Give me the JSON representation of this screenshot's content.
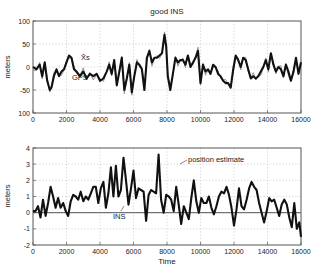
{
  "chart_data": [
    {
      "type": "line",
      "title": "good INS",
      "xlabel": "",
      "ylabel": "meters",
      "xlim": [
        0,
        16000
      ],
      "ylim": [
        -100,
        100
      ],
      "xticks": [
        0,
        2000,
        4000,
        6000,
        8000,
        10000,
        12000,
        14000,
        16000
      ],
      "xtick_labels": [
        "0",
        "2000",
        "4000",
        "6000",
        "8000",
        "10000",
        "12000",
        "14000",
        "16000"
      ],
      "yticks": [
        100,
        50,
        0,
        -50,
        -100
      ],
      "ytick_labels": [
        "100",
        "50",
        "0",
        "-50",
        "100"
      ],
      "grid": true,
      "annotations": [
        {
          "text": "X̂s",
          "x": 2700,
          "y": 18
        },
        {
          "text": "GPS",
          "x": 2400,
          "y": -18
        }
      ],
      "series": [
        {
          "name": "X̂s (estimate)",
          "style": "thick",
          "x": [
            0,
            200,
            400,
            550,
            700,
            850,
            1000,
            1100,
            1250,
            1400,
            1550,
            1700,
            1850,
            2000,
            2150,
            2300,
            2450,
            2600,
            2800,
            3000,
            3200,
            3400,
            3600,
            3800,
            4000,
            4200,
            4400,
            4550,
            4700,
            4850,
            5000,
            5150,
            5300,
            5450,
            5600,
            5750,
            5900,
            6050,
            6200,
            6350,
            6500,
            6650,
            6800,
            6950,
            7100,
            7250,
            7400,
            7550,
            7700,
            7850,
            7950,
            8050,
            8200,
            8350,
            8500,
            8650,
            8800,
            8950,
            9100,
            9250,
            9400,
            9550,
            9700,
            9850,
            10000,
            10150,
            10300,
            10450,
            10600,
            10750,
            10900,
            11050,
            11200,
            11350,
            11500,
            11650,
            11800,
            11950,
            12100,
            12250,
            12400,
            12550,
            12700,
            12850,
            13000,
            13150,
            13300,
            13450,
            13600,
            13750,
            13900,
            14050,
            14200,
            14350,
            14500,
            14650,
            14800,
            14950,
            15100,
            15250,
            15400,
            15550,
            15700,
            15850,
            16000
          ],
          "values": [
            0,
            -5,
            5,
            -20,
            10,
            -30,
            -50,
            -45,
            -20,
            -5,
            -20,
            -10,
            -5,
            10,
            25,
            20,
            -5,
            -10,
            -20,
            -10,
            -25,
            -15,
            -20,
            -15,
            -30,
            -25,
            -10,
            5,
            -15,
            15,
            -40,
            -10,
            20,
            -50,
            -25,
            5,
            -55,
            -20,
            10,
            5,
            -5,
            -50,
            20,
            35,
            10,
            20,
            20,
            25,
            30,
            70,
            45,
            -20,
            -50,
            -15,
            20,
            10,
            15,
            15,
            5,
            25,
            0,
            10,
            20,
            35,
            -35,
            5,
            -10,
            -5,
            -15,
            5,
            0,
            -15,
            -20,
            -30,
            -35,
            -35,
            -45,
            -5,
            25,
            15,
            0,
            20,
            15,
            -5,
            -25,
            -20,
            -25,
            -20,
            -10,
            0,
            15,
            -5,
            30,
            5,
            -10,
            0,
            -5,
            -20,
            5,
            -10,
            -30,
            -10,
            20,
            -15,
            10
          ],
          "color": "#111111"
        },
        {
          "name": "GPS",
          "style": "thin",
          "color": "#777777"
        }
      ]
    },
    {
      "type": "line",
      "title": "",
      "xlabel": "Time",
      "ylabel": "meters",
      "xlim": [
        0,
        16000
      ],
      "ylim": [
        -2,
        4
      ],
      "xticks": [
        0,
        2000,
        4000,
        6000,
        8000,
        10000,
        12000,
        14000,
        16000
      ],
      "xtick_labels": [
        "0",
        "2000",
        "4000",
        "6000",
        "8000",
        "10000",
        "12000",
        "14000",
        "16000"
      ],
      "yticks": [
        4,
        3,
        2,
        1,
        0,
        -1,
        -2
      ],
      "ytick_labels": [
        "4",
        "3",
        "2",
        "1",
        "0",
        "-1",
        "-2"
      ],
      "grid": true,
      "annotations": [
        {
          "text": "position estimate",
          "x": 8400,
          "y": 3.0
        },
        {
          "text": "INS",
          "x": 4700,
          "y": -0.75
        }
      ],
      "series": [
        {
          "name": "position estimate",
          "style": "thick",
          "x": [
            0,
            150,
            300,
            450,
            600,
            750,
            900,
            1050,
            1200,
            1350,
            1500,
            1650,
            1800,
            1950,
            2100,
            2250,
            2400,
            2550,
            2700,
            2850,
            3000,
            3150,
            3300,
            3450,
            3600,
            3750,
            3900,
            4050,
            4200,
            4350,
            4500,
            4650,
            4800,
            4950,
            5100,
            5250,
            5400,
            5550,
            5700,
            5850,
            6000,
            6150,
            6300,
            6450,
            6600,
            6750,
            6900,
            7050,
            7200,
            7350,
            7500,
            7650,
            7800,
            7950,
            8100,
            8250,
            8400,
            8550,
            8700,
            8850,
            9000,
            9150,
            9300,
            9450,
            9600,
            9750,
            9900,
            10050,
            10200,
            10350,
            10500,
            10650,
            10800,
            10950,
            11100,
            11250,
            11400,
            11550,
            11700,
            11850,
            12000,
            12150,
            12300,
            12450,
            12600,
            12750,
            12900,
            13050,
            13200,
            13350,
            13500,
            13650,
            13800,
            13950,
            14100,
            14250,
            14400,
            14550,
            14700,
            14850,
            15000,
            15150,
            15300,
            15450,
            15600,
            15750,
            15900,
            16000
          ],
          "values": [
            0.1,
            0.1,
            0.4,
            -0.3,
            0.8,
            -0.2,
            0.6,
            1.6,
            1.0,
            0.3,
            0.9,
            0.3,
            0.6,
            0.1,
            -0.2,
            0.7,
            1.1,
            1.0,
            0.8,
            1.3,
            0.7,
            1.0,
            0.8,
            1.2,
            1.6,
            1.6,
            0.6,
            1.5,
            1.9,
            0.3,
            1.2,
            2.8,
            1.0,
            2.9,
            1.0,
            1.4,
            3.4,
            2.0,
            0.5,
            1.5,
            2.6,
            0.9,
            1.5,
            1.4,
            1.3,
            -0.5,
            1.1,
            1.4,
            1.3,
            1.2,
            3.6,
            0.8,
            0.0,
            1.1,
            1.0,
            0.8,
            0.1,
            1.6,
            0.5,
            -0.7,
            0.4,
            0.0,
            -0.4,
            0.9,
            2.0,
            0.7,
            0.0,
            0.9,
            0.6,
            0.6,
            1.0,
            0.3,
            -0.1,
            0.4,
            1.0,
            1.3,
            1.2,
            1.6,
            1.1,
            0.3,
            -0.8,
            0.2,
            1.5,
            0.4,
            0.2,
            0.8,
            1.5,
            1.9,
            1.6,
            1.4,
            0.6,
            0.0,
            -0.6,
            0.1,
            0.9,
            0.7,
            0.8,
            0.3,
            -0.2,
            0.5,
            0.8,
            0.5,
            -0.3,
            -0.9,
            0.6,
            -1.0,
            -0.6,
            -1.5
          ],
          "color": "#111111"
        },
        {
          "name": "INS",
          "style": "thin",
          "x": [
            0,
            16000
          ],
          "values": [
            0,
            0
          ],
          "color": "#444444"
        }
      ]
    }
  ]
}
